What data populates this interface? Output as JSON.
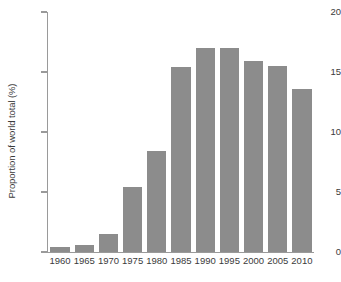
{
  "chart_data": {
    "type": "bar",
    "title": "",
    "subtitle": "",
    "xlabel": "",
    "ylabel": "Proportion of world total (%)",
    "categories": [
      "1960",
      "1965",
      "1970",
      "1975",
      "1980",
      "1985",
      "1990",
      "1995",
      "2000",
      "2005",
      "2010"
    ],
    "values": [
      0.4,
      0.6,
      1.5,
      5.4,
      8.4,
      15.4,
      17.0,
      17.0,
      15.9,
      15.5,
      13.6
    ],
    "ylim": [
      0,
      20
    ],
    "yticks": [
      0,
      5,
      10,
      15,
      20
    ],
    "ytick_labels": [
      "0",
      "5",
      "10",
      "15",
      "20"
    ],
    "grid": false,
    "legend": null,
    "legend_position": "none",
    "bar_color": "#8c8c8c",
    "axis_color": "#9a9a9a",
    "text_color": "#3b3b3b",
    "background_color": "#ffffff",
    "annotations": []
  }
}
